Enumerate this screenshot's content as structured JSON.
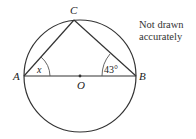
{
  "diagram": {
    "points": {
      "A": {
        "label": "A"
      },
      "B": {
        "label": "B"
      },
      "C": {
        "label": "C"
      },
      "O": {
        "label": "O"
      }
    },
    "angles": {
      "at_A": "x",
      "at_B": "43°"
    },
    "note_line1": "Not drawn",
    "note_line2": "accurately",
    "colors": {
      "stroke": "#333333",
      "text": "#222222",
      "background": "#ffffff"
    }
  }
}
